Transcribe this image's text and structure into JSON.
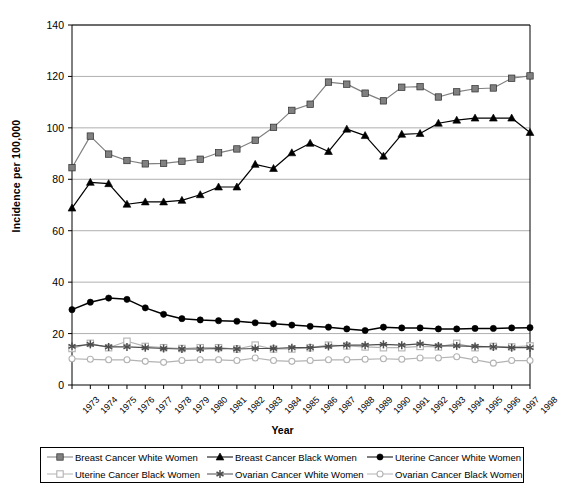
{
  "chart_data": {
    "type": "line",
    "title": "",
    "xlabel": "Year",
    "ylabel": "Incidence per 100,000",
    "xlim": [
      1973,
      1998
    ],
    "ylim": [
      0,
      140
    ],
    "yticks": [
      0,
      20,
      40,
      60,
      80,
      100,
      120,
      140
    ],
    "grid": true,
    "legend_position": "bottom",
    "categories": [
      1973,
      1974,
      1975,
      1976,
      1977,
      1978,
      1979,
      1980,
      1981,
      1982,
      1983,
      1984,
      1985,
      1986,
      1987,
      1988,
      1989,
      1990,
      1991,
      1992,
      1993,
      1994,
      1995,
      1996,
      1997,
      1998
    ],
    "x": [
      "1973",
      "1974",
      "1975",
      "1976",
      "1977",
      "1978",
      "1979",
      "1980",
      "1981",
      "1982",
      "1983",
      "1984",
      "1985",
      "1986",
      "1987",
      "1988",
      "1989",
      "1990",
      "1991",
      "1992",
      "1993",
      "1994",
      "1995",
      "1996",
      "1997",
      "1998"
    ],
    "series": [
      {
        "name": "Breast Cancer White Women",
        "marker": "filled-square",
        "color": "#808080",
        "values": [
          84.5,
          96.8,
          89.8,
          87.3,
          86.0,
          86.2,
          87.0,
          87.8,
          90.3,
          91.8,
          95.2,
          100.2,
          106.8,
          109.2,
          117.8,
          117.0,
          113.5,
          110.5,
          115.8,
          116.0,
          112.0,
          114.0,
          115.2,
          115.5,
          119.3,
          120.2
        ]
      },
      {
        "name": "Breast Cancer Black Women",
        "marker": "filled-triangle",
        "color": "#000000",
        "values": [
          68.8,
          78.8,
          78.3,
          70.3,
          71.2,
          71.2,
          71.8,
          74.0,
          77.0,
          77.0,
          85.8,
          84.2,
          90.3,
          94.0,
          90.8,
          99.5,
          97.0,
          89.0,
          97.5,
          97.8,
          101.8,
          103.0,
          103.8,
          103.8,
          103.8,
          98.2
        ]
      },
      {
        "name": "Uterine Cancer White Women",
        "marker": "filled-circle",
        "color": "#000000",
        "values": [
          29.3,
          32.2,
          33.8,
          33.3,
          30.0,
          27.5,
          25.8,
          25.3,
          25.0,
          24.8,
          24.2,
          23.8,
          23.3,
          22.8,
          22.5,
          21.8,
          21.2,
          22.5,
          22.2,
          22.2,
          21.8,
          21.8,
          22.0,
          22.0,
          22.2,
          22.3
        ]
      },
      {
        "name": "Uterine Cancer Black Women",
        "marker": "open-square",
        "color": "#b3b3b3",
        "values": [
          14.2,
          16.2,
          14.5,
          17.0,
          15.0,
          14.5,
          14.2,
          14.5,
          14.5,
          14.0,
          15.5,
          14.0,
          14.0,
          14.5,
          15.5,
          15.2,
          14.8,
          14.5,
          14.5,
          15.0,
          14.8,
          16.2,
          14.5,
          15.0,
          14.8,
          15.2
        ]
      },
      {
        "name": "Ovarian Cancer White Women",
        "marker": "asterisk",
        "color": "#4d4d4d",
        "values": [
          15.0,
          15.8,
          14.8,
          14.8,
          14.5,
          14.2,
          14.0,
          14.0,
          14.2,
          14.0,
          14.2,
          14.2,
          14.5,
          14.5,
          15.0,
          15.5,
          15.5,
          15.8,
          15.5,
          16.0,
          15.2,
          15.2,
          15.0,
          14.8,
          14.5,
          14.5
        ]
      },
      {
        "name": "Ovarian Cancer Black Women",
        "marker": "open-circle",
        "color": "#b3b3b3",
        "values": [
          10.2,
          10.0,
          9.8,
          9.8,
          9.2,
          8.8,
          9.5,
          9.8,
          9.8,
          9.5,
          10.5,
          9.5,
          9.2,
          9.5,
          9.8,
          9.8,
          10.0,
          10.2,
          10.0,
          10.5,
          10.5,
          11.0,
          9.8,
          8.5,
          9.5,
          9.5
        ]
      }
    ]
  },
  "axes": {
    "ylabel": "Incidence per 100,000",
    "xlabel": "Year"
  },
  "legend": {
    "entries": [
      {
        "label": "Breast Cancer White Women"
      },
      {
        "label": "Breast Cancer Black Women"
      },
      {
        "label": "Uterine Cancer White Women"
      },
      {
        "label": "Uterine Cancer Black Women"
      },
      {
        "label": "Ovarian Cancer White Women"
      },
      {
        "label": "Ovarian Cancer Black Women"
      }
    ]
  }
}
